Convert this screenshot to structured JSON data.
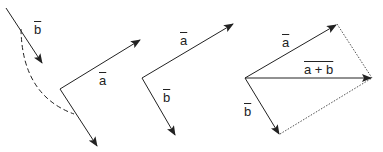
{
  "diagram": {
    "panel1": {
      "label_b": "b",
      "label_a": "a",
      "description": "vector b translated along dashed arc to tail of a"
    },
    "panel2": {
      "label_a": "a",
      "label_b": "b"
    },
    "panel3": {
      "label_a": "a",
      "label_b": "b",
      "label_sum": "a + b"
    },
    "colors": {
      "stroke": "#222222",
      "background": "#ffffff"
    }
  }
}
